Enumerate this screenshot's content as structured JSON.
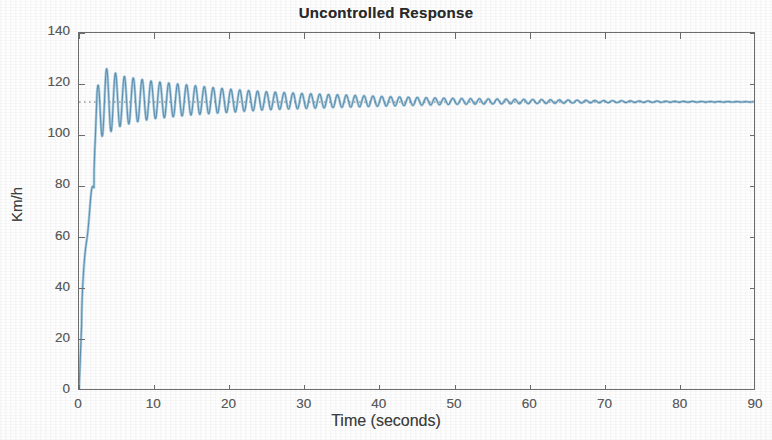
{
  "chart_data": {
    "type": "line",
    "title": "Uncontrolled Response",
    "xlabel": "Time (seconds)",
    "ylabel": "Km/h",
    "xlim": [
      0,
      90
    ],
    "ylim": [
      0,
      140
    ],
    "xticks": [
      0,
      10,
      20,
      30,
      40,
      50,
      60,
      70,
      80,
      90
    ],
    "yticks": [
      0,
      20,
      40,
      60,
      80,
      100,
      120,
      140
    ],
    "grid": false,
    "legend": null,
    "box": true,
    "tick_direction": "in",
    "series": [
      {
        "name": "Uncontrolled vehicle speed",
        "color": "#6ea8c8",
        "linewidth": 1.1,
        "description": "Step response of an uncontrolled (open-loop) cruise-control system: fast rise from 0 km/h, large lightly-damped oscillation overshooting to about 126 km/h, slowly decaying to a steady state near 113 km/h.",
        "steady_state": 113,
        "peak_overshoot": 126,
        "min_after_overshoot": 99,
        "oscillation_period_s": 1.18,
        "rise_time_s": 2.0,
        "settling_behaviour": "very lightly damped, still visibly oscillating at 90 s",
        "x": [
          0,
          0.4,
          0.8,
          1.1,
          1.3,
          1.5,
          1.7,
          1.9,
          2.1,
          2.4,
          2.7,
          3.0,
          3.3,
          3.6,
          4.0,
          4.5,
          5.0,
          6.0,
          8.0,
          10.0,
          15.0,
          20.0,
          25.0,
          30.0,
          40.0,
          50.0,
          60.0,
          70.0,
          80.0,
          90.0
        ],
        "y_envelope_upper": [
          0,
          25,
          60,
          80,
          86,
          82,
          79,
          88,
          104,
          118,
          122,
          124,
          125.5,
          126,
          126,
          125,
          124,
          123,
          122,
          121,
          119.5,
          118,
          117,
          116.3,
          115.2,
          114.4,
          114.0,
          113.7,
          113.5,
          113.4
        ],
        "y_envelope_lower": [
          0,
          25,
          60,
          78,
          80,
          76,
          75,
          80,
          92,
          98,
          99,
          99.5,
          100,
          100.5,
          101,
          102,
          103,
          104,
          105.5,
          106.5,
          108,
          109,
          110,
          110.5,
          111.4,
          112.1,
          112.4,
          112.7,
          112.9,
          113.0
        ],
        "reference_line": {
          "value": 113,
          "style": "dotted",
          "color": "#555555",
          "label": "target / steady-state speed"
        }
      }
    ]
  },
  "figure": {
    "title": "Uncontrolled Response",
    "xlabel": "Time (seconds)",
    "ylabel": "Km/h",
    "xticklabels": [
      "0",
      "10",
      "20",
      "30",
      "40",
      "50",
      "60",
      "70",
      "80",
      "90"
    ],
    "yticklabels": [
      "0",
      "20",
      "40",
      "60",
      "80",
      "100",
      "120",
      "140"
    ],
    "trace_color": "#6ea8c8",
    "axis_color": "#6d6d6d",
    "background_color": "#ffffff"
  }
}
